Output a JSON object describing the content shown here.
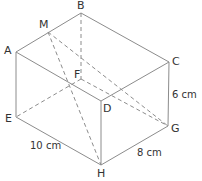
{
  "diagram": {
    "type": "rectangular-prism",
    "vertices": {
      "A": {
        "label": "A",
        "x": 16,
        "y": 52
      },
      "B": {
        "label": "B",
        "x": 81,
        "y": 13
      },
      "C": {
        "label": "C",
        "x": 169,
        "y": 62
      },
      "D": {
        "label": "D",
        "x": 101,
        "y": 101
      },
      "E": {
        "label": "E",
        "x": 16,
        "y": 117
      },
      "F": {
        "label": "F",
        "x": 81,
        "y": 79
      },
      "G": {
        "label": "G",
        "x": 168,
        "y": 126
      },
      "H": {
        "label": "H",
        "x": 101,
        "y": 165
      },
      "M": {
        "label": "M",
        "x": 48,
        "y": 32
      }
    },
    "solid_edges": [
      [
        "A",
        "B"
      ],
      [
        "B",
        "C"
      ],
      [
        "C",
        "D"
      ],
      [
        "D",
        "A"
      ],
      [
        "A",
        "E"
      ],
      [
        "E",
        "H"
      ],
      [
        "H",
        "G"
      ],
      [
        "G",
        "C"
      ],
      [
        "D",
        "H"
      ]
    ],
    "dashed_edges": [
      [
        "B",
        "F"
      ],
      [
        "F",
        "E"
      ],
      [
        "F",
        "G"
      ],
      [
        "M",
        "H"
      ],
      [
        "M",
        "G"
      ]
    ],
    "dimensions": {
      "EH": "10 cm",
      "HG": "8 cm",
      "CG": "6 cm"
    },
    "line_color": "#8c8c8c",
    "text_color": "#333333"
  }
}
